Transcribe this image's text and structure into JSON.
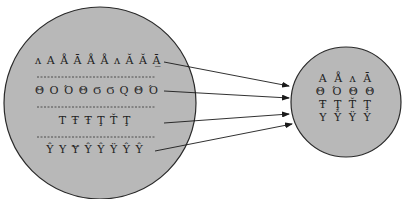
{
  "diagram": {
    "colors": {
      "circle_fill": "#b8b8b8",
      "circle_stroke": "#2a2a2a",
      "arrow": "#1a1a1a",
      "text": "#222222",
      "background": "#ffffff"
    },
    "left_circle": {
      "label": "source glyph variants",
      "rows": [
        {
          "glyphs": "ʌ Α Å Ā Å Å ʌ Ă Ă Ā̲"
        },
        {
          "glyphs": "Θ Ο Ό Θ Ϭ Ϭ Q Θ Ό"
        },
        {
          "glyphs": "Τ Ŧ Ŧ Ţ Ť Ţ"
        },
        {
          "glyphs": "Ŷ Y Ɏ Ŷ Ŷ Ÿ Ŷ Ŷ"
        }
      ]
    },
    "right_circle": {
      "label": "canonical glyphs",
      "rows": [
        {
          "glyphs": "Α Å ʌ Ā"
        },
        {
          "glyphs": "Θ Ό Θ Θ"
        },
        {
          "glyphs": "Ŧ Ţ Ť Ţ"
        },
        {
          "glyphs": "Υ Ŷ Ÿ Ẏ"
        }
      ]
    },
    "arrows": [
      {
        "from": "left_row_1",
        "to": "right_circle"
      },
      {
        "from": "left_row_2",
        "to": "right_circle"
      },
      {
        "from": "left_row_3",
        "to": "right_circle"
      },
      {
        "from": "left_row_4",
        "to": "right_circle"
      }
    ]
  }
}
